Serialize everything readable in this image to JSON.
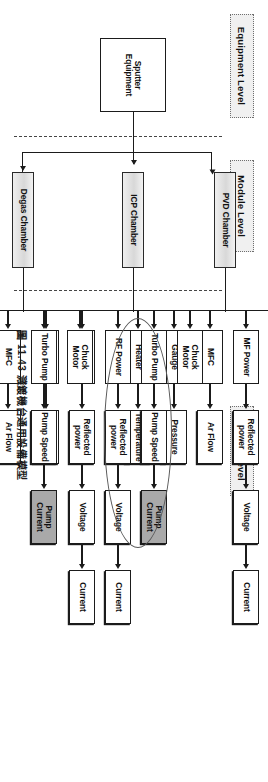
{
  "figure": {
    "caption": "圖 11.43 濺鍍機台通用設備模型",
    "levels": [
      {
        "id": "equipment",
        "label": "Equipment Level"
      },
      {
        "id": "module",
        "label": "Module Level"
      },
      {
        "id": "device",
        "label": "Device Level"
      }
    ],
    "equipment": {
      "label": "Sputter Equipment"
    },
    "modules": [
      {
        "id": "pvd",
        "label": "PVD Chamber"
      },
      {
        "id": "icp",
        "label": "ICP Chamber"
      },
      {
        "id": "degas",
        "label": "Degas Chamber"
      }
    ],
    "highlight": {
      "shaded_box": "Pump Current",
      "ellipse_row": "icp-turbo-pump"
    },
    "colors": {
      "line": "#1b1b1b",
      "module_fill": "#d8d8d8",
      "shaded_fill": "#a9a9a9",
      "level_fill": "#f0f0f0",
      "level_border": "#6f6f6f",
      "ellipse": "#585858"
    },
    "chains": [
      {
        "module": "pvd",
        "rows": [
          {
            "id": "pvd-chuck",
            "nodes": [
              "Chuck Motor"
            ]
          },
          {
            "id": "pvd-mf",
            "nodes": [
              "MF Power",
              "Reflected power",
              "Voltage",
              "Current"
            ]
          },
          {
            "id": "pvd-mfc",
            "nodes": [
              "MFC",
              "Ar Flow"
            ]
          },
          {
            "id": "pvd-gauge",
            "nodes": [
              "Gauge",
              "Pressure"
            ]
          },
          {
            "id": "pvd-heater",
            "nodes": [
              "Heater",
              "Temperature"
            ]
          }
        ]
      },
      {
        "module": "icp",
        "rows": [
          {
            "id": "icp-chuck",
            "nodes": [
              "Chuck Motor"
            ]
          },
          {
            "id": "icp-turbo",
            "nodes": [
              "Turbo Pump",
              "Pump Speed",
              "Pump Current"
            ]
          },
          {
            "id": "icp-rf",
            "nodes": [
              "RF Power",
              "Reflected power",
              "Voltage",
              "Current"
            ]
          },
          {
            "id": "icp-mf",
            "nodes": [
              "MF Power",
              "Reflected power",
              "Voltage",
              "Current"
            ]
          },
          {
            "id": "icp-chiller",
            "nodes": [
              "Chiller",
              "Temperature"
            ]
          }
        ]
      },
      {
        "module": "degas",
        "rows": [
          {
            "id": "degas-chuck",
            "nodes": [
              "Chuck Motor"
            ]
          },
          {
            "id": "degas-turbo",
            "nodes": [
              "Turbo Pump",
              "Pump Speed",
              "Pump Current"
            ]
          },
          {
            "id": "degas-mfc",
            "nodes": [
              "MFC",
              "Ar Flow"
            ]
          },
          {
            "id": "degas-gauge",
            "nodes": [
              "Gauge",
              "Pressure"
            ]
          },
          {
            "id": "degas-heater",
            "nodes": [
              "Heater",
              "Temperature"
            ]
          }
        ]
      }
    ]
  }
}
